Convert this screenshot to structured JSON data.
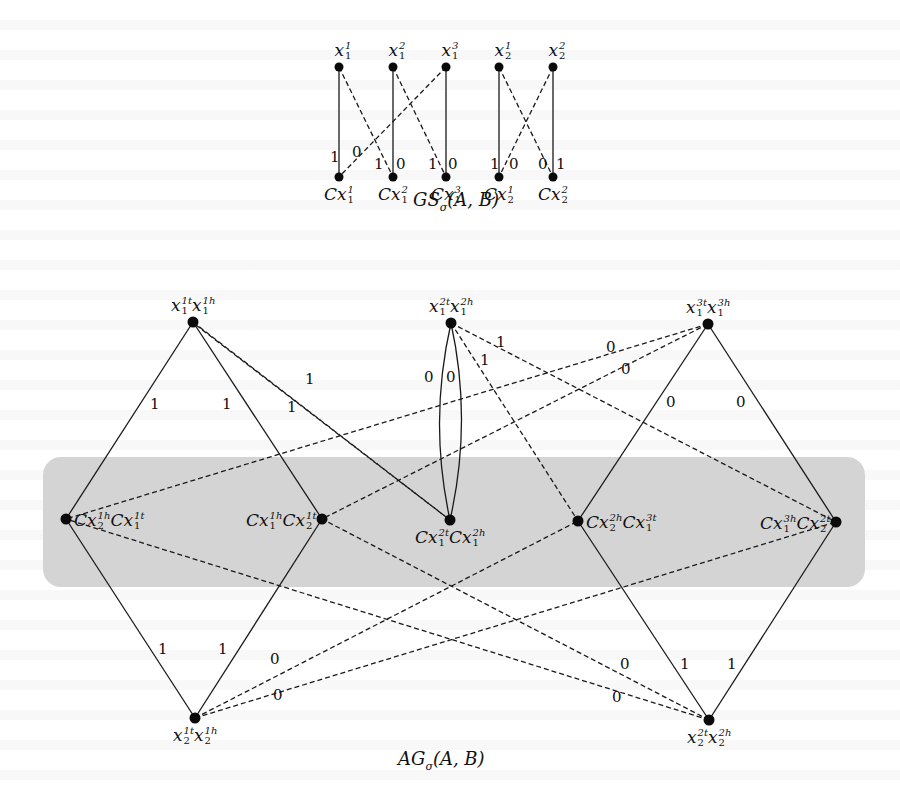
{
  "top_graph": {
    "caption": "GS",
    "caption_sub": "σ",
    "caption_args": "(A, B)",
    "variable_nodes": [
      {
        "id": "x1_1",
        "base": "x",
        "sup": "1",
        "sub": "1",
        "x": 339,
        "y": 67
      },
      {
        "id": "x1_2",
        "base": "x",
        "sup": "2",
        "sub": "1",
        "x": 393,
        "y": 67
      },
      {
        "id": "x1_3",
        "base": "x",
        "sup": "3",
        "sub": "1",
        "x": 446,
        "y": 67
      },
      {
        "id": "x2_1",
        "base": "x",
        "sup": "1",
        "sub": "2",
        "x": 499,
        "y": 67
      },
      {
        "id": "x2_2",
        "base": "x",
        "sup": "2",
        "sub": "2",
        "x": 553,
        "y": 67
      }
    ],
    "clause_nodes": [
      {
        "id": "Cx1_1",
        "base": "Cx",
        "sup": "1",
        "sub": "1",
        "x": 339,
        "y": 177
      },
      {
        "id": "Cx1_2",
        "base": "Cx",
        "sup": "2",
        "sub": "1",
        "x": 393,
        "y": 177
      },
      {
        "id": "Cx1_3",
        "base": "Cx",
        "sup": "3",
        "sub": "1",
        "x": 446,
        "y": 177
      },
      {
        "id": "Cx2_1",
        "base": "Cx",
        "sup": "1",
        "sub": "2",
        "x": 499,
        "y": 177
      },
      {
        "id": "Cx2_2",
        "base": "Cx",
        "sup": "2",
        "sub": "2",
        "x": 553,
        "y": 177
      }
    ],
    "edges": [
      {
        "from": "x1_1",
        "to": "Cx1_1",
        "style": "solid"
      },
      {
        "from": "x1_1",
        "to": "Cx1_2",
        "style": "dashed"
      },
      {
        "from": "x1_2",
        "to": "Cx1_2",
        "style": "solid"
      },
      {
        "from": "x1_2",
        "to": "Cx1_3",
        "style": "dashed"
      },
      {
        "from": "x1_3",
        "to": "Cx1_3",
        "style": "solid"
      },
      {
        "from": "x1_3",
        "to": "Cx1_1",
        "style": "dashed"
      },
      {
        "from": "x2_1",
        "to": "Cx2_1",
        "style": "solid"
      },
      {
        "from": "x2_1",
        "to": "Cx2_2",
        "style": "dashed"
      },
      {
        "from": "x2_2",
        "to": "Cx2_2",
        "style": "solid"
      },
      {
        "from": "x2_2",
        "to": "Cx2_1",
        "style": "dashed"
      }
    ],
    "edge_labels": [
      {
        "text": "1",
        "x": 330,
        "y": 150
      },
      {
        "text": "0",
        "x": 352,
        "y": 145
      },
      {
        "text": "1",
        "x": 374,
        "y": 157
      },
      {
        "text": "0",
        "x": 396,
        "y": 157
      },
      {
        "text": "1",
        "x": 428,
        "y": 157
      },
      {
        "text": "0",
        "x": 448,
        "y": 157
      },
      {
        "text": "1",
        "x": 490,
        "y": 157
      },
      {
        "text": "0",
        "x": 509,
        "y": 157
      },
      {
        "text": "0",
        "x": 538,
        "y": 157
      },
      {
        "text": "1",
        "x": 556,
        "y": 157
      }
    ]
  },
  "bottom_graph": {
    "caption": "AG",
    "caption_sub": "σ",
    "caption_args": "(A, B)",
    "highlight_band": {
      "x": 43,
      "y": 457,
      "width": 822,
      "height": 130,
      "color": "#d4d4d4",
      "radius": 18
    },
    "nodes": [
      {
        "id": "n_x1_1",
        "label_parts": [
          {
            "base": "x",
            "sup": "1t",
            "sub": "1"
          },
          {
            "base": "x",
            "sup": "1h",
            "sub": "1"
          }
        ],
        "x": 193,
        "y": 322,
        "label_pos": "above"
      },
      {
        "id": "n_x1_2",
        "label_parts": [
          {
            "base": "x",
            "sup": "2t",
            "sub": "1"
          },
          {
            "base": "x",
            "sup": "2h",
            "sub": "1"
          }
        ],
        "x": 451,
        "y": 323,
        "label_pos": "above"
      },
      {
        "id": "n_x1_3",
        "label_parts": [
          {
            "base": "x",
            "sup": "3t",
            "sub": "1"
          },
          {
            "base": "x",
            "sup": "3h",
            "sub": "1"
          }
        ],
        "x": 708,
        "y": 324,
        "label_pos": "above"
      },
      {
        "id": "n_c_a",
        "label_parts": [
          {
            "base": "Cx",
            "sup": "1h",
            "sub": "2"
          },
          {
            "base": "Cx",
            "sup": "1t",
            "sub": "1"
          }
        ],
        "x": 66,
        "y": 519,
        "label_pos": "right"
      },
      {
        "id": "n_c_b",
        "label_parts": [
          {
            "base": "Cx",
            "sup": "1h",
            "sub": "1"
          },
          {
            "base": "Cx",
            "sup": "1t",
            "sub": "2"
          }
        ],
        "x": 322,
        "y": 519,
        "label_pos": "left"
      },
      {
        "id": "n_c_c",
        "label_parts": [
          {
            "base": "Cx",
            "sup": "2t",
            "sub": "1"
          },
          {
            "base": "Cx",
            "sup": "2h",
            "sub": "1"
          }
        ],
        "x": 450,
        "y": 520,
        "label_pos": "below"
      },
      {
        "id": "n_c_d",
        "label_parts": [
          {
            "base": "Cx",
            "sup": "2h",
            "sub": "2"
          },
          {
            "base": "Cx",
            "sup": "3t",
            "sub": "1"
          }
        ],
        "x": 578,
        "y": 521,
        "label_pos": "right"
      },
      {
        "id": "n_c_e",
        "label_parts": [
          {
            "base": "Cx",
            "sup": "3h",
            "sub": "1"
          },
          {
            "base": "Cx",
            "sup": "2t",
            "sub": "2"
          }
        ],
        "x": 836,
        "y": 522,
        "label_pos": "left"
      },
      {
        "id": "n_x2_1",
        "label_parts": [
          {
            "base": "x",
            "sup": "1t",
            "sub": "2"
          },
          {
            "base": "x",
            "sup": "1h",
            "sub": "2"
          }
        ],
        "x": 195,
        "y": 718,
        "label_pos": "below"
      },
      {
        "id": "n_x2_2",
        "label_parts": [
          {
            "base": "x",
            "sup": "2t",
            "sub": "2"
          },
          {
            "base": "x",
            "sup": "2h",
            "sub": "2"
          }
        ],
        "x": 709,
        "y": 720,
        "label_pos": "below"
      }
    ],
    "edges": [
      {
        "from": "n_x1_1",
        "to": "n_c_a",
        "style": "solid"
      },
      {
        "from": "n_x1_1",
        "to": "n_c_b",
        "style": "solid"
      },
      {
        "from": "n_x1_1",
        "to": "n_c_c",
        "style": "dashed"
      },
      {
        "from": "n_x1_1",
        "to": "n_c_c",
        "style": "dashed",
        "offset": 1
      },
      {
        "from": "n_x1_2",
        "to": "n_c_c",
        "style": "solid",
        "curve": -22
      },
      {
        "from": "n_x1_2",
        "to": "n_c_c",
        "style": "solid",
        "curve": 22
      },
      {
        "from": "n_x1_2",
        "to": "n_c_d",
        "style": "dashed"
      },
      {
        "from": "n_x1_2",
        "to": "n_c_e",
        "style": "dashed"
      },
      {
        "from": "n_x1_3",
        "to": "n_c_a",
        "style": "dashed"
      },
      {
        "from": "n_x1_3",
        "to": "n_c_b",
        "style": "dashed"
      },
      {
        "from": "n_x1_3",
        "to": "n_c_d",
        "style": "solid"
      },
      {
        "from": "n_x1_3",
        "to": "n_c_e",
        "style": "solid"
      },
      {
        "from": "n_x2_1",
        "to": "n_c_a",
        "style": "solid"
      },
      {
        "from": "n_x2_1",
        "to": "n_c_b",
        "style": "solid"
      },
      {
        "from": "n_x2_1",
        "to": "n_c_d",
        "style": "dashed"
      },
      {
        "from": "n_x2_1",
        "to": "n_c_e",
        "style": "dashed"
      },
      {
        "from": "n_x2_2",
        "to": "n_c_d",
        "style": "solid"
      },
      {
        "from": "n_x2_2",
        "to": "n_c_e",
        "style": "solid"
      },
      {
        "from": "n_x2_2",
        "to": "n_c_a",
        "style": "dashed"
      },
      {
        "from": "n_x2_2",
        "to": "n_c_b",
        "style": "dashed"
      }
    ],
    "edge_labels": [
      {
        "text": "1",
        "x": 150,
        "y": 397
      },
      {
        "text": "1",
        "x": 222,
        "y": 397
      },
      {
        "text": "1",
        "x": 287,
        "y": 400
      },
      {
        "text": "1",
        "x": 305,
        "y": 372
      },
      {
        "text": "0",
        "x": 424,
        "y": 370
      },
      {
        "text": "0",
        "x": 446,
        "y": 370
      },
      {
        "text": "1",
        "x": 480,
        "y": 353
      },
      {
        "text": "1",
        "x": 496,
        "y": 335
      },
      {
        "text": "0",
        "x": 606,
        "y": 340
      },
      {
        "text": "0",
        "x": 621,
        "y": 362
      },
      {
        "text": "0",
        "x": 666,
        "y": 395
      },
      {
        "text": "0",
        "x": 736,
        "y": 395
      },
      {
        "text": "1",
        "x": 158,
        "y": 642
      },
      {
        "text": "1",
        "x": 218,
        "y": 642
      },
      {
        "text": "0",
        "x": 270,
        "y": 652
      },
      {
        "text": "0",
        "x": 273,
        "y": 688
      },
      {
        "text": "0",
        "x": 620,
        "y": 657
      },
      {
        "text": "0",
        "x": 612,
        "y": 690
      },
      {
        "text": "1",
        "x": 680,
        "y": 657
      },
      {
        "text": "1",
        "x": 727,
        "y": 657
      }
    ]
  }
}
